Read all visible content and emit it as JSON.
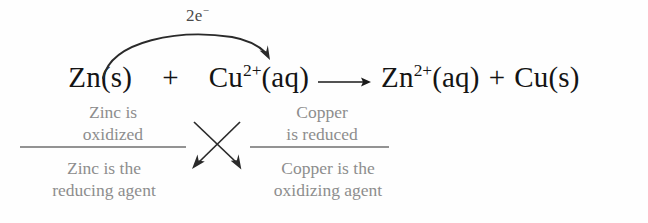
{
  "diagram": {
    "type": "redox-reaction-annotation",
    "colors": {
      "background": "#fefefe",
      "equation_text": "#141414",
      "annotation_text": "#8d8d8d",
      "rule_line": "#6f6f6f",
      "arrow": "#2a2a2a",
      "electron_label": "#4a4a4a"
    }
  },
  "electron_transfer": {
    "label_number": "2e",
    "label_charge": "−",
    "from": "Zn(s)",
    "to": "Cu",
    "description": "curved arrow showing transfer of two electrons from zinc to copper"
  },
  "equation": {
    "reactant_1": {
      "symbol": "Zn",
      "state": "(s)",
      "charge": ""
    },
    "operator_1": "+",
    "reactant_2": {
      "symbol": "Cu",
      "charge": "2+",
      "state": "(aq)"
    },
    "yields": "⟶",
    "product_1": {
      "symbol": "Zn",
      "charge": "2+",
      "state": "(aq)"
    },
    "operator_2": "+",
    "product_2": {
      "symbol": "Cu",
      "state": "(s)",
      "charge": ""
    }
  },
  "annotations": {
    "oxidized": {
      "line1": "Zinc is",
      "line2": "oxidized"
    },
    "reduced": {
      "line1": "Copper",
      "line2": "is reduced"
    },
    "reducing_agent": {
      "line1": "Zinc is the",
      "line2": "reducing agent"
    },
    "oxidizing_agent": {
      "line1": "Copper is the",
      "line2": "oxidizing agent"
    }
  },
  "cross_arrows": {
    "description": "two crossing arrows linking oxidized/reduced statements to reducing/oxidizing agent statements",
    "left_to_right": "Zinc is oxidized → Copper is the oxidizing agent",
    "right_to_left": "Copper is reduced → Zinc is the reducing agent"
  }
}
